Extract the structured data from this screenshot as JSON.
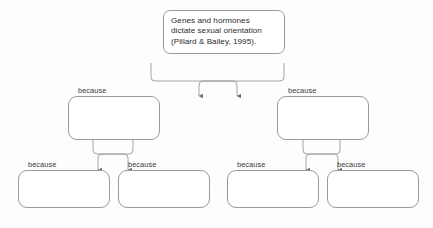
{
  "diagram": {
    "type": "argument-tree",
    "background_color": "#fdfdfd",
    "stroke_color": "#9a9a9a",
    "text_color": "#2c2c2c",
    "edge_label": "because",
    "nodes": {
      "root": {
        "id": "root",
        "level": 1,
        "text": "Genes and hormones\ndictate sexual orientation\n(Pillard & Bailey, 1995).",
        "empty": false
      },
      "mid_left": {
        "id": "mid-left",
        "level": 2,
        "text": "",
        "empty": true
      },
      "mid_right": {
        "id": "mid-right",
        "level": 2,
        "text": "",
        "empty": true
      },
      "leaf_1": {
        "id": "leaf-1",
        "level": 3,
        "text": "",
        "empty": true
      },
      "leaf_2": {
        "id": "leaf-2",
        "level": 3,
        "text": "",
        "empty": true
      },
      "leaf_3": {
        "id": "leaf-3",
        "level": 3,
        "text": "",
        "empty": true
      },
      "leaf_4": {
        "id": "leaf-4",
        "level": 3,
        "text": "",
        "empty": true
      }
    },
    "edges": [
      {
        "id": "edge-mid-left-to-root",
        "from": "mid_left",
        "to": "root",
        "label": "because"
      },
      {
        "id": "edge-mid-right-to-root",
        "from": "mid_right",
        "to": "root",
        "label": "because"
      },
      {
        "id": "edge-leaf-1-to-mid-left",
        "from": "leaf_1",
        "to": "mid_left",
        "label": "because"
      },
      {
        "id": "edge-leaf-2-to-mid-left",
        "from": "leaf_2",
        "to": "mid_left",
        "label": "because"
      },
      {
        "id": "edge-leaf-3-to-mid-right",
        "from": "leaf_3",
        "to": "mid_right",
        "label": "because"
      },
      {
        "id": "edge-leaf-4-to-mid-right",
        "from": "leaf_4",
        "to": "mid_right",
        "label": "because"
      }
    ]
  }
}
